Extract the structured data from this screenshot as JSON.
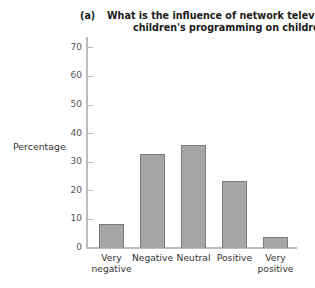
{
  "chart_data": {
    "type": "bar",
    "panel_label": "(a)",
    "title_line1": "What is the influence of network television's",
    "title_line2": "children's programming on children?",
    "xlabel": "",
    "ylabel": "Percentage",
    "categories": [
      "Very negative",
      "Negative",
      "Neutral",
      "Positive",
      "Very positive"
    ],
    "category_lines": [
      [
        "Very",
        "negative"
      ],
      [
        "Negative",
        ""
      ],
      [
        "Neutral",
        ""
      ],
      [
        "Positive",
        ""
      ],
      [
        "Very",
        "positive"
      ]
    ],
    "values": [
      8,
      32.5,
      35.5,
      23,
      3.5
    ],
    "ylim": [
      0,
      70
    ],
    "yticks": [
      "0",
      "10",
      "20",
      "30",
      "40",
      "50",
      "60",
      "70"
    ],
    "grid": false,
    "legend": null,
    "colors": {
      "bar_fill": "#a6a6a6",
      "bar_border": "#7a7a7a",
      "axis": "#bdbdbd"
    }
  }
}
